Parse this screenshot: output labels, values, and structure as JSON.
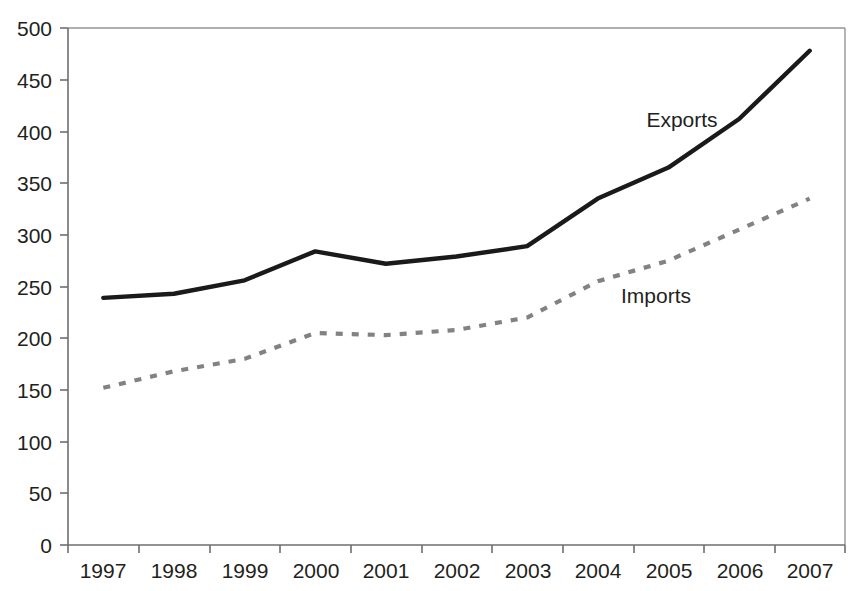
{
  "chart_data": {
    "type": "line",
    "title": "",
    "xlabel": "",
    "ylabel": "",
    "categories": [
      "1997",
      "1998",
      "1999",
      "2000",
      "2001",
      "2002",
      "2003",
      "2004",
      "2005",
      "2006",
      "2007"
    ],
    "series": [
      {
        "name": "Exports",
        "style": "solid",
        "color": "#1a1a1a",
        "values": [
          239,
          243,
          256,
          284,
          272,
          279,
          289,
          335,
          365,
          412,
          478
        ]
      },
      {
        "name": "Imports",
        "style": "dashed",
        "color": "#808285",
        "values": [
          152,
          168,
          180,
          205,
          203,
          208,
          220,
          255,
          275,
          305,
          335
        ]
      }
    ],
    "ylim": [
      0,
      500
    ],
    "ytick_step": 50,
    "yticks": [
      "0",
      "50",
      "100",
      "150",
      "200",
      "250",
      "300",
      "350",
      "400",
      "450",
      "500"
    ],
    "grid": false,
    "legend_position": "inline-annotations",
    "annotations": [
      {
        "text": "Exports",
        "x_value": "2005",
        "y_value": 404
      },
      {
        "text": "Imports",
        "x_value": "2003",
        "y_value": 249
      }
    ]
  },
  "axes": {
    "y_ticks": [
      "500",
      "450",
      "400",
      "350",
      "300",
      "250",
      "200",
      "150",
      "100",
      "50",
      "0"
    ],
    "x_ticks": [
      "1997",
      "1998",
      "1999",
      "2000",
      "2001",
      "2002",
      "2003",
      "2004",
      "2005",
      "2006",
      "2007"
    ]
  },
  "labels": {
    "exports": "Exports",
    "imports": "Imports"
  }
}
